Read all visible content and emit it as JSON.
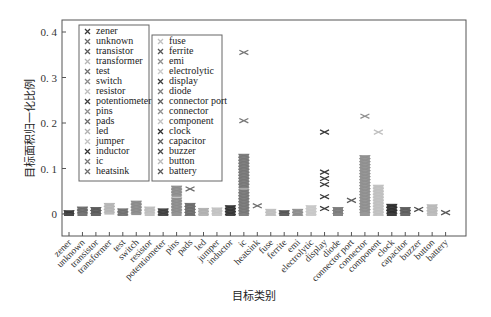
{
  "chart_data": {
    "type": "scatter",
    "subtype": "strip/swarm plot with x markers",
    "title": "",
    "xlabel": "目标类别",
    "ylabel": "目标面积归一化比例",
    "ylim": [
      -0.012,
      0.42
    ],
    "yticks": [
      0,
      0.1,
      0.2,
      0.3,
      0.4
    ],
    "ytick_labels": [
      "0",
      "0. 1",
      "0. 2",
      "0. 3",
      "0. 4"
    ],
    "grid": false,
    "legend_position": "upper left, two boxes",
    "categories": [
      "zener",
      "unknown",
      "transistor",
      "transformer",
      "test",
      "switch",
      "resistor",
      "potentiometer",
      "pins",
      "pads",
      "led",
      "jumper",
      "inductor",
      "ic",
      "heatsink",
      "fuse",
      "ferrite",
      "emi",
      "electrolytic",
      "display",
      "diode",
      "connector port",
      "connector",
      "component",
      "clock",
      "capacitor",
      "buzzer",
      "button",
      "battery"
    ],
    "series": [
      {
        "name": "zener",
        "color": "#3a3a3a",
        "bands": [
          [
            0.0,
            0.004
          ]
        ],
        "outliers": []
      },
      {
        "name": "unknown",
        "color": "#6a6a6a",
        "bands": [
          [
            0.0,
            0.012
          ]
        ],
        "outliers": []
      },
      {
        "name": "transistor",
        "color": "#5a5a5a",
        "bands": [
          [
            0.0,
            0.011
          ]
        ],
        "outliers": []
      },
      {
        "name": "transformer",
        "color": "#b5b5b5",
        "bands": [
          [
            0.003,
            0.02
          ]
        ],
        "outliers": []
      },
      {
        "name": "test",
        "color": "#707070",
        "bands": [
          [
            0.0,
            0.008
          ]
        ],
        "outliers": []
      },
      {
        "name": "switch",
        "color": "#8a8a8a",
        "bands": [
          [
            0.002,
            0.025
          ]
        ],
        "outliers": []
      },
      {
        "name": "resistor",
        "color": "#bdbdbd",
        "bands": [
          [
            0.0,
            0.012
          ]
        ],
        "outliers": []
      },
      {
        "name": "potentiometer",
        "color": "#3f3f3f",
        "bands": [
          [
            0.0,
            0.008
          ]
        ],
        "outliers": []
      },
      {
        "name": "pins",
        "color": "#8c8c8c",
        "bands": [
          [
            0.0,
            0.032
          ],
          [
            0.042,
            0.058
          ]
        ],
        "outliers": []
      },
      {
        "name": "pads",
        "color": "#6c6c6c",
        "bands": [
          [
            0.0,
            0.02
          ]
        ],
        "outliers": [
          0.055
        ]
      },
      {
        "name": "led",
        "color": "#b0b0b0",
        "bands": [
          [
            0.0,
            0.009
          ]
        ],
        "outliers": []
      },
      {
        "name": "jumper",
        "color": "#c2c2c2",
        "bands": [
          [
            0.0,
            0.01
          ]
        ],
        "outliers": []
      },
      {
        "name": "inductor",
        "color": "#353535",
        "bands": [
          [
            0.0,
            0.015
          ]
        ],
        "outliers": []
      },
      {
        "name": "ic",
        "color": "#777777",
        "bands": [
          [
            0.0,
            0.05
          ],
          [
            0.06,
            0.128
          ]
        ],
        "outliers": [
          0.205,
          0.355
        ]
      },
      {
        "name": "heatsink",
        "color": "#6e6e6e",
        "bands": [],
        "outliers": [
          0.018
        ]
      },
      {
        "name": "fuse",
        "color": "#bfbfbf",
        "bands": [
          [
            0.0,
            0.007
          ]
        ],
        "outliers": []
      },
      {
        "name": "ferrite",
        "color": "#555555",
        "bands": [
          [
            0.0,
            0.004
          ]
        ],
        "outliers": []
      },
      {
        "name": "emi",
        "color": "#8e8e8e",
        "bands": [
          [
            0.0,
            0.007
          ]
        ],
        "outliers": []
      },
      {
        "name": "electrolytic",
        "color": "#c8c8c8",
        "bands": [
          [
            0.0,
            0.015
          ]
        ],
        "outliers": []
      },
      {
        "name": "display",
        "color": "#3c3c3c",
        "bands": [],
        "outliers": [
          0.012,
          0.038,
          0.065,
          0.078,
          0.092,
          0.18
        ]
      },
      {
        "name": "diode",
        "color": "#7c7c7c",
        "bands": [
          [
            0.0,
            0.011
          ]
        ],
        "outliers": []
      },
      {
        "name": "connector port",
        "color": "#5e5e5e",
        "bands": [],
        "outliers": [
          0.03
        ]
      },
      {
        "name": "connector",
        "color": "#8f8f8f",
        "bands": [
          [
            0.0,
            0.125
          ]
        ],
        "outliers": [
          0.215
        ]
      },
      {
        "name": "component",
        "color": "#c0c0c0",
        "bands": [
          [
            0.0,
            0.06
          ]
        ],
        "outliers": [
          0.18
        ]
      },
      {
        "name": "clock",
        "color": "#2e2e2e",
        "bands": [
          [
            0.0,
            0.018
          ]
        ],
        "outliers": []
      },
      {
        "name": "capacitor",
        "color": "#5d5d5d",
        "bands": [
          [
            0.0,
            0.011
          ]
        ],
        "outliers": []
      },
      {
        "name": "buzzer",
        "color": "#4a4a4a",
        "bands": [],
        "outliers": [
          0.01
        ]
      },
      {
        "name": "button",
        "color": "#b9b9b9",
        "bands": [
          [
            0.0,
            0.017
          ]
        ],
        "outliers": []
      },
      {
        "name": "battery",
        "color": "#5a5a5a",
        "bands": [],
        "outliers": [
          0.003
        ]
      }
    ],
    "legend_col1": [
      "zener",
      "unknown",
      "transistor",
      "transformer",
      "test",
      "switch",
      "resistor",
      "potentiometer",
      "pins",
      "pads",
      "led",
      "jumper",
      "inductor",
      "ic",
      "heatsink"
    ],
    "legend_col2": [
      "fuse",
      "ferrite",
      "emi",
      "electrolytic",
      "display",
      "diode",
      "connector port",
      "connector",
      "component",
      "clock",
      "capacitor",
      "buzzer",
      "button",
      "battery"
    ]
  }
}
